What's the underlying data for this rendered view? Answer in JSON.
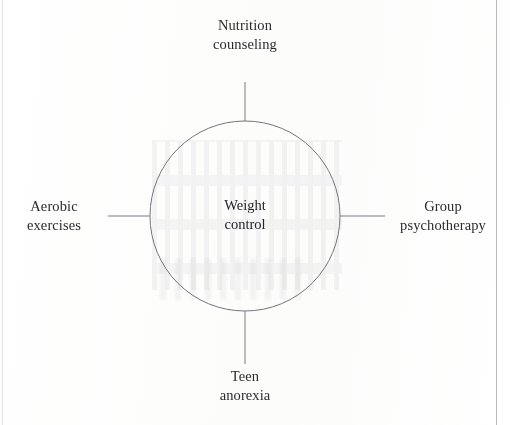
{
  "diagram": {
    "type": "cluster-web-diagram",
    "center": {
      "line1": "Weight",
      "line2": "control",
      "full_text": "Weight control"
    },
    "nodes": [
      {
        "position": "top",
        "line1": "Nutrition",
        "line2": "counseling",
        "full_text": "Nutrition counseling"
      },
      {
        "position": "right",
        "line1": "Group",
        "line2": "psychotherapy",
        "full_text": "Group psychotherapy"
      },
      {
        "position": "bottom",
        "line1": "Teen",
        "line2": "anorexia",
        "full_text": "Teen anorexia"
      },
      {
        "position": "left",
        "line1": "Aerobic",
        "line2": "exercises",
        "full_text": "Aerobic exercises"
      }
    ]
  },
  "colors": {
    "page_background": "#fefefe",
    "ink": "#2b2b30",
    "stroke": "#6e6e76",
    "page_rule": "#b9b9bb"
  },
  "geometry": {
    "circle_center_x": 245,
    "circle_center_y": 216,
    "circle_radius": 95
  }
}
